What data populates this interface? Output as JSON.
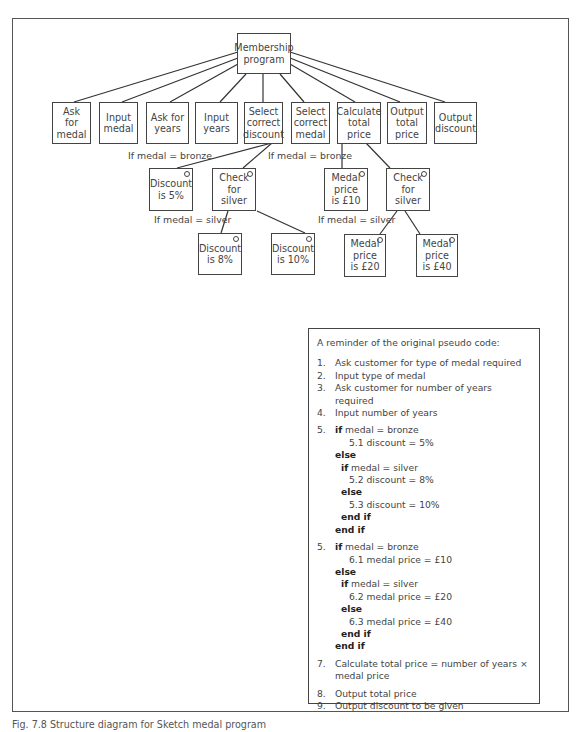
{
  "diagram": {
    "root": {
      "label": "Membership\nprogram"
    },
    "children": [
      {
        "label": "Ask\nfor\nmedal"
      },
      {
        "label": "Input\nmedal"
      },
      {
        "label": "Ask for\nyears"
      },
      {
        "label": "Input\nyears"
      },
      {
        "label": "Select\ncorrect\ndiscount"
      },
      {
        "label": "Select\ncorrect\nmedal"
      },
      {
        "label": "Calculate\ntotal\nprice"
      },
      {
        "label": "Output\ntotal\nprice"
      },
      {
        "label": "Output\ndiscount"
      }
    ],
    "discount_branch": {
      "discount_5": "Discount\nis 5%",
      "check_silver": "Check\nfor\nsilver",
      "discount_8": "Discount\nis 8%",
      "discount_10": "Discount\nis 10%",
      "cond_bronze": "If medal = bronze",
      "cond_silver": "If medal = silver"
    },
    "medal_branch": {
      "price_10": "Medal\nprice\nis £10",
      "check_silver": "Check\nfor\nsilver",
      "price_20": "Medal\nprice\nis £20",
      "price_40": "Medal\nprice\nis £40",
      "cond_bronze": "If medal = bronze",
      "cond_silver": "If medal = silver"
    }
  },
  "pseudo": {
    "title": "A reminder of the original pseudo code:",
    "lines": [
      {
        "num": "1.",
        "text": "Ask customer for type of medal required"
      },
      {
        "num": "2.",
        "text": "Input type of medal"
      },
      {
        "num": "3.",
        "text": "Ask customer for number of years required"
      },
      {
        "num": "4.",
        "text": "Input number of years"
      }
    ],
    "block5": {
      "num": "5.",
      "if_kw": "if",
      "if_cond": " medal = bronze",
      "l51": "5.1  discount = 5%",
      "else1": "else",
      "if2_kw": "if",
      "if2_cond": " medal = silver",
      "l52": "5.2  discount = 8%",
      "else2": "else",
      "l53": "5.3  discount = 10%",
      "endif1": "end if",
      "endif2": "end if"
    },
    "block6": {
      "num": "5.",
      "if_kw": "if",
      "if_cond": " medal = bronze",
      "l61": "6.1  medal price = £10",
      "else1": "else",
      "if2_kw": "if",
      "if2_cond": " medal = silver",
      "l62": "6.2  medal price = £20",
      "else2": "else",
      "l63": "6.3  medal price = £40",
      "endif1": "end if",
      "endif2": "end if"
    },
    "line7": {
      "num": "7.",
      "text": "Calculate total price = number of years × medal price"
    },
    "line8": {
      "num": "8.",
      "text": "Output total price"
    },
    "line9": {
      "num": "9.",
      "text": "Output discount to be given"
    }
  },
  "caption": "Fig. 7.8  Structure diagram for Sketch medal program"
}
